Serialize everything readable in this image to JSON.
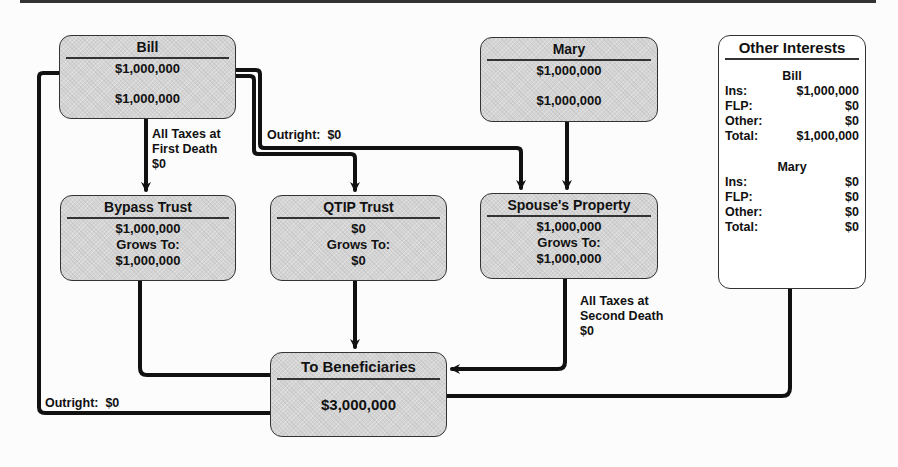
{
  "diagram": {
    "bill": {
      "title": "Bill",
      "value1": "$1,000,000",
      "value2": "$1,000,000"
    },
    "mary": {
      "title": "Mary",
      "value1": "$1,000,000",
      "value2": "$1,000,000"
    },
    "bypass_trust": {
      "title": "Bypass Trust",
      "amount": "$1,000,000",
      "grows_label": "Grows To:",
      "grows_to": "$1,000,000"
    },
    "qtip_trust": {
      "title": "QTIP Trust",
      "amount": "$0",
      "grows_label": "Grows To:",
      "grows_to": "$0"
    },
    "spouses_property": {
      "title": "Spouse's Property",
      "amount": "$1,000,000",
      "grows_label": "Grows To:",
      "grows_to": "$1,000,000"
    },
    "beneficiaries": {
      "title": "To Beneficiaries",
      "amount": "$3,000,000"
    },
    "labels": {
      "taxes_first_death": "All Taxes at\nFirst Death\n$0",
      "outright_top": "Outright:  $0",
      "taxes_second_death": "All Taxes at\nSecond Death\n$0",
      "outright_bottom": "Outright:  $0"
    },
    "other_interests": {
      "title": "Other Interests",
      "bill": {
        "name": "Bill",
        "rows": [
          {
            "label": "Ins:",
            "value": "$1,000,000"
          },
          {
            "label": "FLP:",
            "value": "$0"
          },
          {
            "label": "Other:",
            "value": "$0"
          },
          {
            "label": "Total:",
            "value": "$1,000,000"
          }
        ]
      },
      "mary": {
        "name": "Mary",
        "rows": [
          {
            "label": "Ins:",
            "value": "$0"
          },
          {
            "label": "FLP:",
            "value": "$0"
          },
          {
            "label": "Other:",
            "value": "$0"
          },
          {
            "label": "Total:",
            "value": "$0"
          }
        ]
      }
    },
    "colors": {
      "box_fill": "#d4d4d4",
      "line": "#111111",
      "background": "#fcfcfc"
    }
  }
}
